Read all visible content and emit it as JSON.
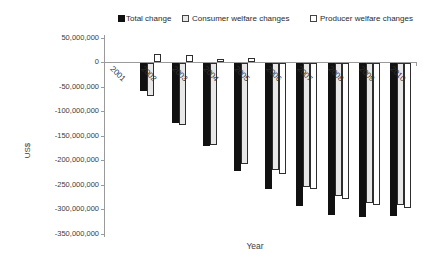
{
  "legend": [
    {
      "label": "Total change",
      "swatch": "#111111",
      "outlined": false
    },
    {
      "label": "Consumer welfare changes",
      "swatch": "#e8e8e8",
      "outlined": true
    },
    {
      "label": "Producer welfare changes",
      "swatch": "#ffffff",
      "outlined": true
    }
  ],
  "chart_data": {
    "type": "bar",
    "title": "",
    "xlabel": "Year",
    "ylabel": "US$",
    "ylim": [
      -350000000,
      50000000
    ],
    "ytick_interval": 50000000,
    "ytick_values": [
      50000000,
      0,
      -50000000,
      -100000000,
      -150000000,
      -200000000,
      -250000000,
      -300000000,
      -350000000
    ],
    "ytick_labels": [
      "50,000,000",
      "0",
      "-50,000,000",
      "-100,000,000",
      "-150,000,000",
      "-200,000,000",
      "-250,000,000",
      "-300,000,000",
      "-350,000,000"
    ],
    "categories": [
      "2001",
      "2002",
      "2003",
      "2004",
      "2005",
      "2006",
      "2007",
      "2008",
      "2009",
      "2010"
    ],
    "series": [
      {
        "name": "Total change",
        "color": "#111111",
        "values": [
          0,
          -57000000,
          -122000000,
          -169000000,
          -220000000,
          -258000000,
          -291000000,
          -310000000,
          -315000000,
          -313000000
        ]
      },
      {
        "name": "Consumer welfare changes",
        "color": "#e8e8e8",
        "values": [
          0,
          -67000000,
          -126000000,
          -168000000,
          -206000000,
          -219000000,
          -254000000,
          -271000000,
          -285000000,
          -290000000
        ]
      },
      {
        "name": "Producer welfare changes",
        "color": "#ffffff",
        "values": [
          0,
          16000000,
          14000000,
          6000000,
          9000000,
          -226000000,
          -258000000,
          -277000000,
          -290000000,
          -296000000
        ]
      }
    ],
    "legend_position": "top",
    "grid": false
  }
}
